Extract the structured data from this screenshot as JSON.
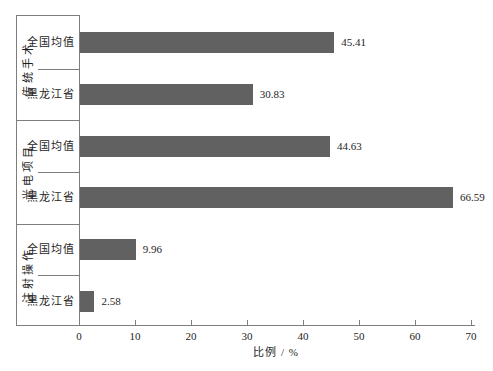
{
  "chart_data": {
    "type": "bar",
    "orientation": "horizontal",
    "title": "",
    "xlabel": "比例 / %",
    "ylabel": "",
    "xlim": [
      0,
      70
    ],
    "xticks": [
      0,
      10,
      20,
      30,
      40,
      50,
      60,
      70
    ],
    "grid": false,
    "legend": "none",
    "value_labels_shown": true,
    "groups": [
      {
        "name": "传统手术",
        "rows": [
          {
            "label": "全国均值",
            "value": 45.41
          },
          {
            "label": "黑龙江省",
            "value": 30.83
          }
        ]
      },
      {
        "name": "光电项目",
        "rows": [
          {
            "label": "全国均值",
            "value": 44.63
          },
          {
            "label": "黑龙江省",
            "value": 66.59
          }
        ]
      },
      {
        "name": "注射操作",
        "rows": [
          {
            "label": "全国均值",
            "value": 9.96
          },
          {
            "label": "黑龙江省",
            "value": 2.58
          }
        ]
      }
    ],
    "bar_color": "#616161",
    "axis_color": "#7d7d7d",
    "text_color": "#1e1e1e",
    "background_color": "#ffffff"
  }
}
